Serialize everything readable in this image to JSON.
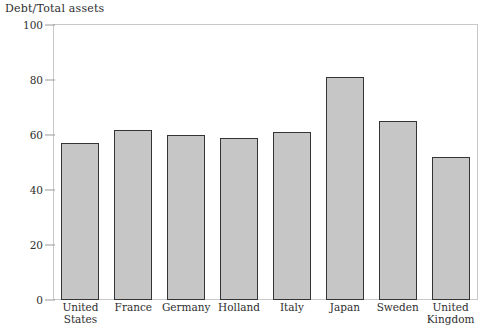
{
  "chart_data": {
    "type": "bar",
    "title": "Debt/Total assets",
    "xlabel": "",
    "ylabel": "",
    "ylim": [
      0,
      100
    ],
    "yticks": [
      0,
      20,
      40,
      60,
      80,
      100
    ],
    "grid": false,
    "legend": "none",
    "bar_fill_color": "#c6c6c6",
    "bar_border_color": "#343434",
    "frame_color": "#c9c9c9",
    "categories": [
      "United States",
      "France",
      "Germany",
      "Holland",
      "Italy",
      "Japan",
      "Sweden",
      "United Kingdom"
    ],
    "category_lines": [
      [
        "United",
        "States"
      ],
      [
        "France"
      ],
      [
        "Germany"
      ],
      [
        "Holland"
      ],
      [
        "Italy"
      ],
      [
        "Japan"
      ],
      [
        "Sweden"
      ],
      [
        "United",
        "Kingdom"
      ]
    ],
    "values": [
      57,
      62,
      60,
      59,
      61,
      81,
      65,
      52
    ]
  }
}
